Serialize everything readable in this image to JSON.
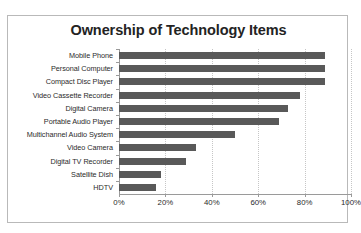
{
  "chart_data": {
    "type": "bar",
    "orientation": "horizontal",
    "title": "Ownership of Technology Items",
    "xlabel": "",
    "ylabel": "",
    "categories": [
      "Mobile Phone",
      "Personal Computer",
      "Compact Disc Player",
      "Video Cassette Recorder",
      "Digital Camera",
      "Portable Audio Player",
      "Multichannel Audio System",
      "Video Camera",
      "Digital TV Recorder",
      "Satellite Dish",
      "HDTV"
    ],
    "values": [
      89,
      89,
      89,
      78,
      73,
      69,
      50,
      33,
      29,
      18,
      16
    ],
    "xlim": [
      0,
      100
    ],
    "xtick_values": [
      0,
      20,
      40,
      60,
      80,
      100
    ],
    "xtick_labels": [
      "0%",
      "20%",
      "40%",
      "60%",
      "80%",
      "100%"
    ],
    "grid": true,
    "grid_axis": "x",
    "legend": false,
    "bar_color": "#595959",
    "grid_color": "#c6c6c6",
    "axis_color": "#9a9a9a",
    "border_color": "#b9b9b9",
    "background": "#ffffff",
    "title_color": "#232323"
  }
}
